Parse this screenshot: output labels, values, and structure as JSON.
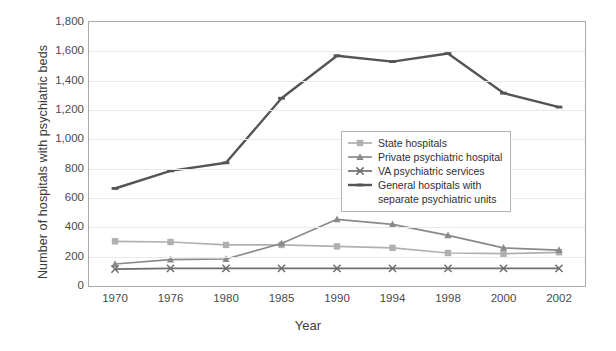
{
  "chart_data": {
    "type": "line",
    "title": "",
    "xlabel": "Year",
    "ylabel": "Number of hospitals with psychiatric beds",
    "categories": [
      "1970",
      "1976",
      "1980",
      "1985",
      "1990",
      "1994",
      "1998",
      "2000",
      "2002"
    ],
    "ylim": [
      0,
      1800
    ],
    "ytick_labels": [
      "0",
      "200",
      "400",
      "600",
      "800",
      "1,000",
      "1,200",
      "1,400",
      "1,600",
      "1,800"
    ],
    "ytick_values": [
      0,
      200,
      400,
      600,
      800,
      1000,
      1200,
      1400,
      1600,
      1800
    ],
    "grid": true,
    "legend_position": "center",
    "series": [
      {
        "name": "State hospitals",
        "color": "#b0b0b0",
        "marker": "square",
        "values": [
          305,
          300,
          280,
          280,
          270,
          260,
          225,
          220,
          230
        ]
      },
      {
        "name": "Private psychiatric hospital",
        "color": "#8a8a8a",
        "marker": "triangle",
        "values": [
          150,
          180,
          184,
          290,
          455,
          420,
          345,
          260,
          245
        ]
      },
      {
        "name": "VA psychiatric services",
        "color": "#6e6e6e",
        "marker": "x",
        "values": [
          115,
          120,
          120,
          120,
          120,
          120,
          120,
          120,
          120
        ]
      },
      {
        "name": "General hospitals with separate psychiatric units",
        "color": "#555555",
        "marker": "dash",
        "values": [
          665,
          785,
          840,
          1280,
          1570,
          1530,
          1585,
          1315,
          1220
        ]
      }
    ]
  },
  "legend": {
    "entries": [
      {
        "label": "State hospitals",
        "sub": ""
      },
      {
        "label": "Private psychiatric hospital",
        "sub": ""
      },
      {
        "label": "VA psychiatric services",
        "sub": ""
      },
      {
        "label": "General hospitals with",
        "sub": "separate psychiatric units"
      }
    ]
  },
  "axes": {
    "y_title": "Number of hospitals with psychiatric beds",
    "x_title": "Year"
  }
}
